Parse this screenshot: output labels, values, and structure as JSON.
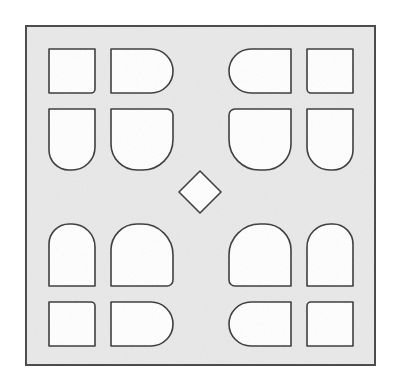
{
  "figure": {
    "name": "perforated-block-pattern",
    "title": "Symmetric perforated square block",
    "canvas": {
      "width": 399,
      "height": 389
    },
    "colors": {
      "page_background": "#ffffff",
      "plate_fill": "#e9e9e9",
      "hole_fill": "#ffffff",
      "outline": "#3a3a3a",
      "plate_border": "#4a4a4a"
    },
    "plate": {
      "name": "outer-square-plate",
      "x": 26,
      "y": 26,
      "width": 349,
      "height": 339,
      "stroke_width": 2
    },
    "grid": {
      "columns": 4,
      "rows": 4,
      "column_x": [
        49,
        111,
        229,
        307
      ],
      "column_width": [
        46,
        62,
        62,
        46
      ],
      "row_y": [
        49,
        109,
        224,
        302
      ],
      "row_height": [
        44,
        61,
        62,
        44
      ]
    },
    "center_diamond": {
      "name": "center-diamond-hole",
      "center_x": 200,
      "center_y": 192,
      "half_width": 21,
      "half_height": 21,
      "rotation_degrees": 45
    },
    "holes": [
      {
        "id": "hole-r1c1",
        "label": "Row 1 Column 1",
        "shape": "square",
        "x": 49,
        "y": 49,
        "width": 46,
        "height": 44,
        "radius_tl": 0,
        "radius_tr": 0,
        "radius_br": 4,
        "radius_bl": 0
      },
      {
        "id": "hole-r1c2",
        "label": "Row 1 Column 2",
        "shape": "rounded-right-end",
        "x": 111,
        "y": 49,
        "width": 62,
        "height": 44,
        "radius_tl": 0,
        "radius_tr": 22,
        "radius_br": 22,
        "radius_bl": 0
      },
      {
        "id": "hole-r1c3",
        "label": "Row 1 Column 3",
        "shape": "rounded-left-end",
        "x": 229,
        "y": 49,
        "width": 62,
        "height": 44,
        "radius_tl": 22,
        "radius_tr": 0,
        "radius_br": 0,
        "radius_bl": 22
      },
      {
        "id": "hole-r1c4",
        "label": "Row 1 Column 4",
        "shape": "square",
        "x": 307,
        "y": 49,
        "width": 46,
        "height": 44,
        "radius_tl": 0,
        "radius_tr": 0,
        "radius_br": 0,
        "radius_bl": 4
      },
      {
        "id": "hole-r2c1",
        "label": "Row 2 Column 1",
        "shape": "rounded-bottom",
        "x": 49,
        "y": 109,
        "width": 46,
        "height": 61,
        "radius_tl": 0,
        "radius_tr": 0,
        "radius_br": 23,
        "radius_bl": 20
      },
      {
        "id": "hole-r2c2",
        "label": "Row 2 Column 2",
        "shape": "rounded-bottom-right-large",
        "x": 111,
        "y": 109,
        "width": 62,
        "height": 61,
        "radius_tl": 0,
        "radius_tr": 6,
        "radius_br": 50,
        "radius_bl": 26
      },
      {
        "id": "hole-r2c3",
        "label": "Row 2 Column 3",
        "shape": "rounded-bottom-left-large",
        "x": 229,
        "y": 109,
        "width": 62,
        "height": 61,
        "radius_tl": 6,
        "radius_tr": 0,
        "radius_br": 26,
        "radius_bl": 50
      },
      {
        "id": "hole-r2c4",
        "label": "Row 2 Column 4",
        "shape": "rounded-bottom",
        "x": 307,
        "y": 109,
        "width": 46,
        "height": 61,
        "radius_tl": 0,
        "radius_tr": 0,
        "radius_br": 20,
        "radius_bl": 23
      },
      {
        "id": "hole-r3c1",
        "label": "Row 3 Column 1",
        "shape": "rounded-top",
        "x": 49,
        "y": 224,
        "width": 46,
        "height": 62,
        "radius_tl": 20,
        "radius_tr": 23,
        "radius_br": 0,
        "radius_bl": 0
      },
      {
        "id": "hole-r3c2",
        "label": "Row 3 Column 2",
        "shape": "rounded-top-right-large",
        "x": 111,
        "y": 224,
        "width": 62,
        "height": 62,
        "radius_tl": 26,
        "radius_tr": 50,
        "radius_br": 6,
        "radius_bl": 0
      },
      {
        "id": "hole-r3c3",
        "label": "Row 3 Column 3",
        "shape": "rounded-top-left-large",
        "x": 229,
        "y": 224,
        "width": 62,
        "height": 62,
        "radius_tl": 50,
        "radius_tr": 26,
        "radius_br": 0,
        "radius_bl": 6
      },
      {
        "id": "hole-r3c4",
        "label": "Row 3 Column 4",
        "shape": "rounded-top",
        "x": 307,
        "y": 224,
        "width": 46,
        "height": 62,
        "radius_tl": 23,
        "radius_tr": 20,
        "radius_br": 0,
        "radius_bl": 0
      },
      {
        "id": "hole-r4c1",
        "label": "Row 4 Column 1",
        "shape": "square",
        "x": 49,
        "y": 302,
        "width": 46,
        "height": 44,
        "radius_tl": 0,
        "radius_tr": 4,
        "radius_br": 0,
        "radius_bl": 0
      },
      {
        "id": "hole-r4c2",
        "label": "Row 4 Column 2",
        "shape": "rounded-right-end",
        "x": 111,
        "y": 302,
        "width": 62,
        "height": 44,
        "radius_tl": 0,
        "radius_tr": 22,
        "radius_br": 22,
        "radius_bl": 0
      },
      {
        "id": "hole-r4c3",
        "label": "Row 4 Column 3",
        "shape": "rounded-left-end",
        "x": 229,
        "y": 302,
        "width": 62,
        "height": 44,
        "radius_tl": 22,
        "radius_tr": 0,
        "radius_br": 0,
        "radius_bl": 22
      },
      {
        "id": "hole-r4c4",
        "label": "Row 4 Column 4",
        "shape": "square",
        "x": 307,
        "y": 302,
        "width": 46,
        "height": 44,
        "radius_tl": 4,
        "radius_tr": 0,
        "radius_br": 0,
        "radius_bl": 0
      }
    ]
  }
}
